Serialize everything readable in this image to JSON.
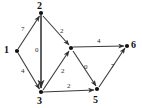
{
  "figure": {
    "kind": "directed-weighted-graph",
    "background_color": "#ffffff",
    "node_color": "#111111",
    "edge_color": "#3a3a3a",
    "node_label_color": "#111111",
    "edge_label_color": "#2b2b2b",
    "width": 142,
    "height": 108
  },
  "graph_data": {
    "type": "diagram",
    "directed": true,
    "weighted": true,
    "nodes": [
      {
        "id": "1",
        "label": "1",
        "x": 17,
        "y": 51,
        "label_x": 4,
        "label_y": 45
      },
      {
        "id": "2",
        "label": "2",
        "x": 41,
        "y": 13,
        "label_x": 37,
        "label_y": 1
      },
      {
        "id": "3",
        "label": "3",
        "x": 41,
        "y": 92,
        "label_x": 37,
        "label_y": 96
      },
      {
        "id": "4",
        "label": "",
        "x": 71,
        "y": 48,
        "label_x": 68,
        "label_y": 36
      },
      {
        "id": "5",
        "label": "5",
        "x": 97,
        "y": 89,
        "label_x": 93,
        "label_y": 95
      },
      {
        "id": "6",
        "label": "6",
        "x": 127,
        "y": 46,
        "label_x": 131,
        "label_y": 40
      }
    ],
    "edges": [
      {
        "from": "1",
        "to": "2",
        "weight": "7",
        "label_x": 21,
        "label_y": 26
      },
      {
        "from": "1",
        "to": "3",
        "weight": "4",
        "label_x": 21,
        "label_y": 68
      },
      {
        "from": "2",
        "to": "3",
        "weight": "0",
        "label_x": 35,
        "label_y": 47
      },
      {
        "from": "2",
        "to": "4",
        "weight": "2",
        "label_x": 60,
        "label_y": 28
      },
      {
        "from": "3",
        "to": "4",
        "weight": "2",
        "label_x": 61,
        "label_y": 68
      },
      {
        "from": "3",
        "to": "5",
        "weight": "2",
        "label_x": 67,
        "label_y": 83
      },
      {
        "from": "4",
        "to": "6",
        "weight": "4",
        "label_x": 97,
        "label_y": 38
      },
      {
        "from": "4",
        "to": "5",
        "weight": "0",
        "label_x": 84,
        "label_y": 64
      },
      {
        "from": "5",
        "to": "6",
        "weight": "7",
        "label_x": 111,
        "label_y": 63
      }
    ]
  }
}
